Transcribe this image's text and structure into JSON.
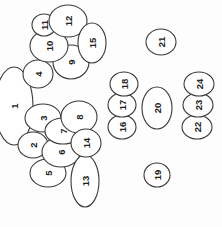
{
  "figure": {
    "background_color": "#fdfdfd",
    "outline_color": "#3a3a3a",
    "label_color": "#202020",
    "label_rotation_deg": -90,
    "width": 222,
    "height": 227,
    "count": 24
  },
  "regions": [
    {
      "id": 1,
      "label": "1",
      "cx": 14,
      "cy": 106,
      "rx": 19,
      "ry": 39,
      "rot": 0
    },
    {
      "id": 2,
      "label": "2",
      "cx": 33,
      "cy": 145,
      "rx": 15,
      "ry": 13,
      "rot": 0
    },
    {
      "id": 3,
      "label": "3",
      "cx": 43,
      "cy": 118,
      "rx": 18,
      "ry": 14,
      "rot": 0
    },
    {
      "id": 4,
      "label": "4",
      "cx": 38,
      "cy": 74,
      "rx": 15,
      "ry": 14,
      "rot": 0
    },
    {
      "id": 5,
      "label": "5",
      "cx": 48,
      "cy": 173,
      "rx": 18,
      "ry": 14,
      "rot": 0
    },
    {
      "id": 6,
      "label": "6",
      "cx": 61,
      "cy": 152,
      "rx": 19,
      "ry": 15,
      "rot": 0
    },
    {
      "id": 7,
      "label": "7",
      "cx": 63,
      "cy": 131,
      "rx": 18,
      "ry": 13,
      "rot": 0
    },
    {
      "id": 8,
      "label": "8",
      "cx": 79,
      "cy": 117,
      "rx": 18,
      "ry": 16,
      "rot": 0
    },
    {
      "id": 9,
      "label": "9",
      "cx": 71,
      "cy": 62,
      "rx": 18,
      "ry": 17,
      "rot": 0
    },
    {
      "id": 10,
      "label": "10",
      "cx": 49,
      "cy": 46,
      "rx": 19,
      "ry": 16,
      "rot": 0
    },
    {
      "id": 11,
      "label": "11",
      "cx": 44,
      "cy": 25,
      "rx": 12,
      "ry": 11,
      "rot": 0
    },
    {
      "id": 12,
      "label": "12",
      "cx": 68,
      "cy": 21,
      "rx": 19,
      "ry": 16,
      "rot": 0
    },
    {
      "id": 13,
      "label": "13",
      "cx": 85,
      "cy": 181,
      "rx": 14,
      "ry": 26,
      "rot": 0
    },
    {
      "id": 14,
      "label": "14",
      "cx": 86,
      "cy": 143,
      "rx": 15,
      "ry": 14,
      "rot": 0
    },
    {
      "id": 15,
      "label": "15",
      "cx": 92,
      "cy": 43,
      "rx": 14,
      "ry": 20,
      "rot": 0
    },
    {
      "id": 16,
      "label": "16",
      "cx": 122,
      "cy": 127,
      "rx": 14,
      "ry": 12,
      "rot": 0
    },
    {
      "id": 17,
      "label": "17",
      "cx": 122,
      "cy": 105,
      "rx": 14,
      "ry": 12,
      "rot": 0
    },
    {
      "id": 18,
      "label": "18",
      "cx": 124,
      "cy": 84,
      "rx": 14,
      "ry": 12,
      "rot": 0
    },
    {
      "id": 19,
      "label": "19",
      "cx": 157,
      "cy": 175,
      "rx": 13,
      "ry": 12,
      "rot": 0
    },
    {
      "id": 20,
      "label": "20",
      "cx": 157,
      "cy": 108,
      "rx": 15,
      "ry": 21,
      "rot": 0
    },
    {
      "id": 21,
      "label": "21",
      "cx": 161,
      "cy": 42,
      "rx": 15,
      "ry": 13,
      "rot": 0
    },
    {
      "id": 22,
      "label": "22",
      "cx": 197,
      "cy": 127,
      "rx": 15,
      "ry": 12,
      "rot": 0
    },
    {
      "id": 23,
      "label": "23",
      "cx": 198,
      "cy": 105,
      "rx": 15,
      "ry": 12,
      "rot": 0
    },
    {
      "id": 24,
      "label": "24",
      "cx": 199,
      "cy": 84,
      "rx": 15,
      "ry": 12,
      "rot": 0
    }
  ]
}
